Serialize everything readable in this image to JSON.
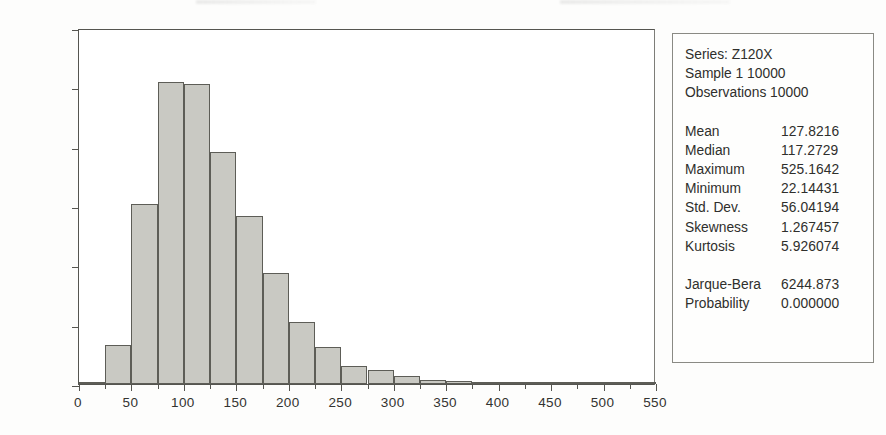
{
  "chart_data": {
    "type": "bar",
    "title": "",
    "subtitle": "",
    "xlabel": "",
    "ylabel": "",
    "xlim": [
      0,
      550
    ],
    "ylim": [
      0,
      2400
    ],
    "bin_width": 25,
    "grid": false,
    "legend": "none",
    "x_ticks": [
      0,
      50,
      100,
      150,
      200,
      250,
      300,
      350,
      400,
      450,
      500,
      550
    ],
    "x_tick_labels": [
      "0",
      "50",
      "100",
      "150",
      "200",
      "250",
      "300",
      "350",
      "400",
      "450",
      "500",
      "550"
    ],
    "x_minor_ticks": [
      25,
      75,
      125,
      175,
      225,
      275,
      325,
      375,
      425,
      475,
      525
    ],
    "y_ticks": [
      0,
      400,
      800,
      1200,
      1600,
      2000,
      2400
    ],
    "y_tick_labels": [
      "0",
      "400",
      "800",
      "1,200",
      "1,600",
      "2,000",
      "2,400"
    ],
    "bins": [
      {
        "start": 0,
        "end": 25,
        "count": 6
      },
      {
        "start": 25,
        "end": 50,
        "count": 265
      },
      {
        "start": 50,
        "end": 75,
        "count": 1215
      },
      {
        "start": 75,
        "end": 100,
        "count": 2035
      },
      {
        "start": 100,
        "end": 125,
        "count": 2020
      },
      {
        "start": 125,
        "end": 150,
        "count": 1565
      },
      {
        "start": 150,
        "end": 175,
        "count": 1130
      },
      {
        "start": 175,
        "end": 200,
        "count": 750
      },
      {
        "start": 200,
        "end": 225,
        "count": 415
      },
      {
        "start": 225,
        "end": 250,
        "count": 250
      },
      {
        "start": 250,
        "end": 275,
        "count": 120
      },
      {
        "start": 275,
        "end": 300,
        "count": 95
      },
      {
        "start": 300,
        "end": 325,
        "count": 55
      },
      {
        "start": 325,
        "end": 350,
        "count": 30
      },
      {
        "start": 350,
        "end": 375,
        "count": 22
      },
      {
        "start": 375,
        "end": 400,
        "count": 6
      },
      {
        "start": 400,
        "end": 425,
        "count": 4
      },
      {
        "start": 425,
        "end": 450,
        "count": 2
      },
      {
        "start": 450,
        "end": 475,
        "count": 1
      },
      {
        "start": 475,
        "end": 500,
        "count": 1
      },
      {
        "start": 500,
        "end": 525,
        "count": 1
      },
      {
        "start": 525,
        "end": 550,
        "count": 1
      }
    ],
    "bar_fill_color": "#c9c9c3",
    "bar_border_color": "#5d5d57"
  },
  "stats_panel": {
    "header": [
      "Series: Z120X",
      "Sample 1 10000",
      "Observations 10000"
    ],
    "rows": [
      {
        "name": "Mean",
        "value": "127.8216"
      },
      {
        "name": "Median",
        "value": "117.2729"
      },
      {
        "name": "Maximum",
        "value": "525.1642"
      },
      {
        "name": "Minimum",
        "value": "22.14431"
      },
      {
        "name": "Std. Dev.",
        "value": "56.04194"
      },
      {
        "name": "Skewness",
        "value": "1.267457"
      },
      {
        "name": "Kurtosis",
        "value": "5.926074"
      }
    ],
    "test_rows": [
      {
        "name": "Jarque-Bera",
        "value": "6244.873"
      },
      {
        "name": "Probability",
        "value": "0.000000"
      }
    ]
  }
}
